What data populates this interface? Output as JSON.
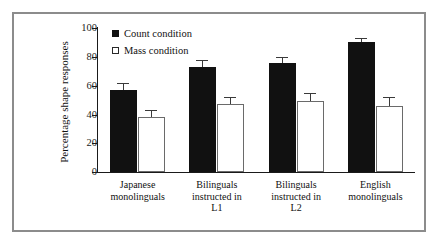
{
  "figure": {
    "frame_color": "#8c8c8c",
    "background": "#ffffff"
  },
  "legend": {
    "position": "top-left-inside",
    "entries": [
      {
        "label": "Count condition",
        "swatch": "filled-black-square",
        "color": "#111111"
      },
      {
        "label": "Mass condition",
        "swatch": "open-white-square",
        "color": "#ffffff"
      }
    ]
  },
  "chart_data": {
    "type": "bar",
    "title": "",
    "xlabel": "",
    "ylabel": "Percentage shape responses",
    "ylim": [
      0,
      100
    ],
    "yticks": [
      0,
      20,
      40,
      60,
      80,
      100
    ],
    "ytick_labels": [
      "0",
      "20",
      "40",
      "60",
      "80",
      "100"
    ],
    "grid": false,
    "legend_position": "upper left",
    "categories": [
      "Japanese monolinguals",
      "Bilinguals instructed in L1",
      "Bilinguals instructed in L2",
      "English monolinguals"
    ],
    "category_lines": [
      [
        "Japanese",
        "monolinguals"
      ],
      [
        "Bilinguals",
        "instructed in",
        "L1"
      ],
      [
        "Bilinguals",
        "instructed in",
        "L2"
      ],
      [
        "English",
        "monolinguals"
      ]
    ],
    "series": [
      {
        "name": "Count condition",
        "color": "#111111",
        "values": [
          57,
          73,
          76,
          90
        ],
        "errors": [
          5,
          5,
          4,
          3
        ]
      },
      {
        "name": "Mass condition",
        "color": "#ffffff",
        "values": [
          38,
          47,
          49,
          46
        ],
        "errors": [
          5,
          5,
          6,
          6
        ]
      }
    ]
  }
}
